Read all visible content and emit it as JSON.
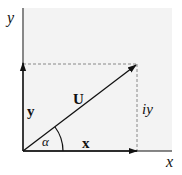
{
  "diagram": {
    "type": "vector-decomposition",
    "colors": {
      "background": "#ffffff",
      "shaded_region": "#f3f3f3",
      "lines": "#111111",
      "dashed": "#888888"
    },
    "axes": {
      "x_label": "x",
      "y_label": "y"
    },
    "vectors": {
      "horizontal_label": "x",
      "vertical_label": "y",
      "resultant_label": "U"
    },
    "annotations": {
      "angle_label": "α",
      "projection_label": "iy"
    }
  }
}
